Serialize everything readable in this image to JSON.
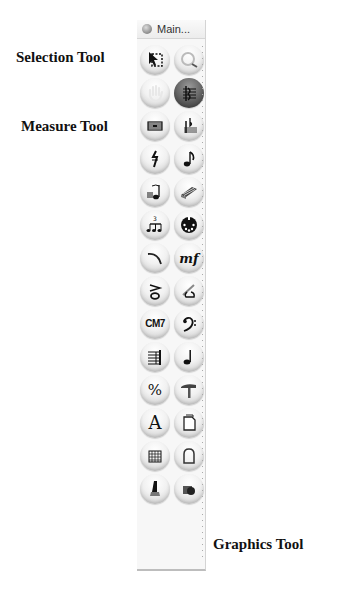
{
  "callouts": {
    "selection": "Selection Tool",
    "measure": "Measure Tool",
    "graphics": "Graphics Tool"
  },
  "palette": {
    "title": "Main...",
    "tools": [
      {
        "name": "selection-tool",
        "icon": "arrow-marquee-icon"
      },
      {
        "name": "zoom-tool",
        "icon": "magnifier-icon"
      },
      {
        "name": "hand-grabber-tool",
        "icon": "hand-icon"
      },
      {
        "name": "staff-tool",
        "icon": "staff-clef-icon",
        "active": true
      },
      {
        "name": "measure-tool",
        "icon": "measure-icon"
      },
      {
        "name": "key-signature-tool",
        "icon": "flat-key-icon"
      },
      {
        "name": "time-signature-tool",
        "icon": "time-signature-icon"
      },
      {
        "name": "simple-entry-tool",
        "icon": "eighth-note-icon"
      },
      {
        "name": "speedy-entry-tool",
        "icon": "speedy-note-icon"
      },
      {
        "name": "hyperscribe-tool",
        "icon": "keyboard-icon"
      },
      {
        "name": "tuplet-tool",
        "icon": "tuplet-icon",
        "glyph_text": "3"
      },
      {
        "name": "midi-tool",
        "icon": "midi-plug-icon"
      },
      {
        "name": "smart-shape-tool",
        "icon": "slur-icon"
      },
      {
        "name": "expression-tool",
        "icon": "mf-dynamic-icon",
        "glyph_text": "mf"
      },
      {
        "name": "articulation-tool",
        "icon": "accent-note-icon"
      },
      {
        "name": "special-tools-tool",
        "icon": "pen-note-icon"
      },
      {
        "name": "chord-tool",
        "icon": "chord-symbol-icon",
        "glyph_text": "CM7"
      },
      {
        "name": "clef-tool",
        "icon": "bass-clef-icon",
        "glyph_text": "𝄢"
      },
      {
        "name": "staff-grid-tool",
        "icon": "staff-lines-icon"
      },
      {
        "name": "note-mover-tool",
        "icon": "quarter-note-icon"
      },
      {
        "name": "repeat-tool",
        "icon": "percent-icon",
        "glyph_text": "%"
      },
      {
        "name": "mass-edit-tool",
        "icon": "hammer-icon"
      },
      {
        "name": "text-tool",
        "icon": "text-a-icon",
        "glyph_text": "A"
      },
      {
        "name": "page-layout-tool",
        "icon": "page-icon"
      },
      {
        "name": "lyrics-grid-tool",
        "icon": "grid-icon"
      },
      {
        "name": "frame-tool",
        "icon": "arch-frame-icon"
      },
      {
        "name": "ossia-tool",
        "icon": "pen-nib-icon"
      },
      {
        "name": "graphics-tool",
        "icon": "camera-graphics-icon"
      }
    ]
  }
}
